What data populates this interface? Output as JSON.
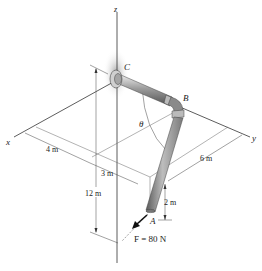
{
  "figure": {
    "axes": {
      "x_label": "x",
      "y_label": "y",
      "z_label": "z"
    },
    "points": {
      "A": "A",
      "B": "B",
      "C": "C"
    },
    "angle_label": "θ",
    "dimensions": {
      "d_4m": "4 m",
      "d_3m": "3 m",
      "d_6m": "6 m",
      "d_12m": "12 m",
      "d_2m": "2 m"
    },
    "force": {
      "label": "F = 80 N",
      "symbol": "F",
      "value": "80 N"
    },
    "colors": {
      "pipe_dark": "#6e6e6e",
      "pipe_light": "#d9d9d9",
      "line": "#333333",
      "shadow": "#b5b5b5"
    }
  }
}
